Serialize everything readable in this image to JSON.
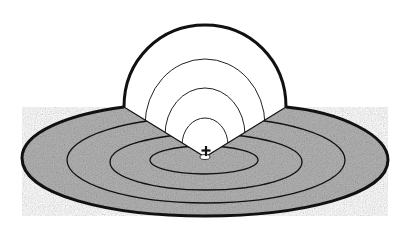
{
  "diagram": {
    "colors": {
      "background": "#ffffff",
      "ground_fill": "#a8a8a8",
      "outline": "#111111",
      "hemisphere_fill": "#ffffff"
    },
    "center_marker": {
      "icon": "cross-icon",
      "glyph": "+"
    },
    "hemisphere": {
      "arc_count": 4
    },
    "ground_plane": {
      "ring_count": 4
    }
  }
}
